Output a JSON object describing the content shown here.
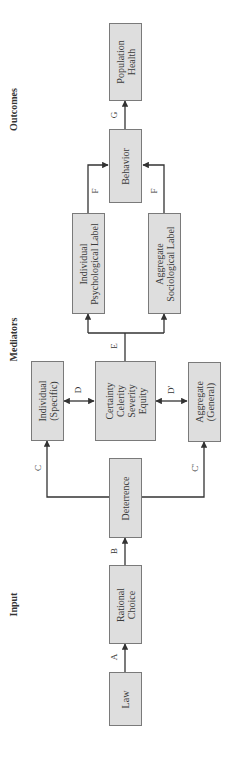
{
  "columns": {
    "input": "Input",
    "mediators": "Mediators",
    "outcomes": "Outcomes"
  },
  "nodes": {
    "law": "Law",
    "rational_choice": [
      "Rational",
      "Choice"
    ],
    "deterrence": "Deterrence",
    "individual_specific": [
      "Individual",
      "(Specific)"
    ],
    "aggregate_general": [
      "Aggregate",
      "(General)"
    ],
    "certainty": [
      "Certainty",
      "Celerity",
      "Severity",
      "Equity"
    ],
    "individual_psych": [
      "Individual",
      "Psychological Label"
    ],
    "aggregate_socio": [
      "Aggregate",
      "Sociological Label"
    ],
    "behavior": "Behavior",
    "population_health": [
      "Population",
      "Health"
    ]
  },
  "edges": {
    "a": "A",
    "b": "B",
    "c": "C",
    "c_prime": "C'",
    "d": "D",
    "d_prime": "D'",
    "e": "E",
    "f1": "F",
    "f2": "F",
    "g": "G"
  },
  "colors": {
    "box_fill": "#dedede",
    "box_border": "#7a7a7a",
    "line": "#333333"
  }
}
